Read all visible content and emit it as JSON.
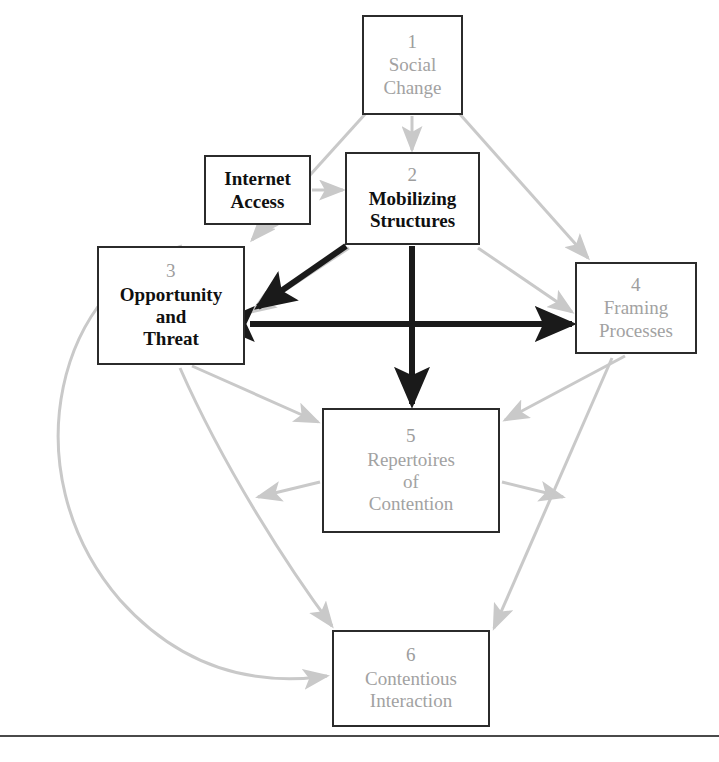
{
  "diagram": {
    "colors": {
      "gray_arrow": "#c9c9c9",
      "dark_arrow": "#1a1a1a",
      "box_border": "#2b2b2b",
      "gray_text": "#a2a2a2",
      "dark_text": "#101010",
      "background": "#ffffff",
      "rule": "#4a4a4a"
    },
    "nodes": [
      {
        "id": "box-1",
        "number": "1",
        "lines": [
          "Social",
          "Change"
        ],
        "style": "gray"
      },
      {
        "id": "box-2",
        "number": "2",
        "lines": [
          "Mobilizing",
          "Structures"
        ],
        "style": "dark"
      },
      {
        "id": "box-internet",
        "number": "",
        "lines": [
          "Internet",
          "Access"
        ],
        "style": "dark"
      },
      {
        "id": "box-3",
        "number": "3",
        "lines": [
          "Opportunity",
          "and",
          "Threat"
        ],
        "style": "dark"
      },
      {
        "id": "box-4",
        "number": "4",
        "lines": [
          "Framing",
          "Processes"
        ],
        "style": "gray"
      },
      {
        "id": "box-5",
        "number": "5",
        "lines": [
          "Repertoires",
          "of",
          "Contention"
        ],
        "style": "gray"
      },
      {
        "id": "box-6",
        "number": "6",
        "lines": [
          "Contentious",
          "Interaction"
        ],
        "style": "gray"
      }
    ],
    "edges": [
      {
        "from": "1",
        "to": "2",
        "weight": "light",
        "direction": "one-way"
      },
      {
        "from": "1",
        "to": "3",
        "weight": "light",
        "direction": "one-way"
      },
      {
        "from": "1",
        "to": "4",
        "weight": "light",
        "direction": "one-way"
      },
      {
        "from": "2",
        "to": "3",
        "weight": "light",
        "direction": "one-way"
      },
      {
        "from": "2",
        "to": "4",
        "weight": "light",
        "direction": "one-way"
      },
      {
        "from": "internet-access",
        "to": "2",
        "weight": "light",
        "direction": "one-way"
      },
      {
        "from": "internet-access",
        "to": "3",
        "weight": "light",
        "direction": "one-way"
      },
      {
        "from": "3",
        "to": "5",
        "weight": "light",
        "direction": "one-way"
      },
      {
        "from": "3",
        "to": "6",
        "weight": "light",
        "direction": "one-way"
      },
      {
        "from": "4",
        "to": "5",
        "weight": "light",
        "direction": "one-way"
      },
      {
        "from": "4",
        "to": "6",
        "weight": "light",
        "direction": "one-way"
      },
      {
        "from": "5",
        "to": "3",
        "weight": "light",
        "direction": "one-way"
      },
      {
        "from": "5",
        "to": "4",
        "weight": "light",
        "direction": "one-way"
      },
      {
        "from": "2",
        "to": "3",
        "weight": "heavy",
        "direction": "one-way"
      },
      {
        "from": "2",
        "to": "5",
        "weight": "heavy",
        "direction": "one-way"
      },
      {
        "from": "3",
        "to": "4",
        "weight": "heavy",
        "direction": "two-way"
      }
    ]
  }
}
